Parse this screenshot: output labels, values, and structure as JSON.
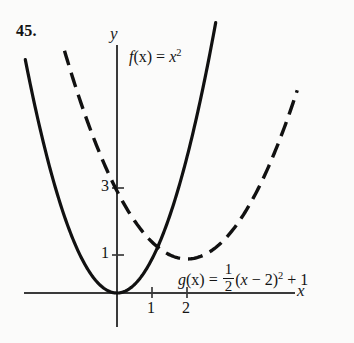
{
  "figure": {
    "problem_number": "45.",
    "background_color": "#fbfbfa",
    "curve_color": "#111111",
    "axis_color": "#333333"
  },
  "axes": {
    "x_axis_label": "x",
    "y_axis_label": "y",
    "origin_px": [
      117,
      293
    ],
    "unit_px_x": 35,
    "unit_px_y": 34,
    "x_ticks": [
      {
        "value": 1,
        "label": "1"
      },
      {
        "value": 2,
        "label": "2"
      }
    ],
    "y_ticks": [
      {
        "value": 1,
        "label": "1"
      },
      {
        "value": 3,
        "label": "3"
      }
    ]
  },
  "labels": {
    "f_name": "f",
    "f_arg": "(x)",
    "f_eq": " = ",
    "f_base": "x",
    "f_exp": "2",
    "g_name": "g",
    "g_arg": "(x)",
    "g_eq": " = ",
    "frac_num": "1",
    "frac_den": "2",
    "g_paren_open": "(",
    "g_var": "x",
    "g_minus": " − ",
    "g_shift": "2",
    "g_paren_close": ")",
    "g_exp": "2",
    "g_plus": " + ",
    "g_const": "1"
  },
  "chart_data": {
    "type": "line",
    "title": "",
    "xlabel": "x",
    "ylabel": "y",
    "xlim": [
      -2.65,
      5.1
    ],
    "ylim": [
      -1.0,
      7.3
    ],
    "grid": false,
    "legend": "inline-annotations",
    "series": [
      {
        "name": "f(x) = x^2",
        "style": "solid",
        "expression": "x^2",
        "vertex": [
          0,
          0
        ],
        "x": [
          -2.6,
          -2.2,
          -1.8,
          -1.4,
          -1.0,
          -0.6,
          -0.2,
          0,
          0.2,
          0.6,
          1.0,
          1.4,
          1.8,
          2.2,
          2.6,
          2.8
        ],
        "y": [
          6.76,
          4.84,
          3.24,
          1.96,
          1.0,
          0.36,
          0.04,
          0,
          0.04,
          0.36,
          1.0,
          1.96,
          3.24,
          4.84,
          6.76,
          7.84
        ]
      },
      {
        "name": "g(x) = 1/2 (x - 2)^2 + 1",
        "style": "dashed",
        "expression": "0.5*(x-2)^2+1",
        "vertex": [
          2,
          1
        ],
        "y_intercept": 3,
        "x": [
          -1.5,
          -1.0,
          -0.5,
          0,
          0.5,
          1.0,
          1.5,
          2.0,
          2.5,
          3.0,
          3.5,
          4.0,
          4.5,
          5.0
        ],
        "y": [
          7.125,
          5.5,
          4.125,
          3.0,
          2.125,
          1.5,
          1.125,
          1.0,
          1.125,
          1.5,
          2.125,
          3.0,
          4.125,
          5.5
        ]
      }
    ],
    "annotations": [
      {
        "text": "f(x) = x^2",
        "x": 0.35,
        "y": 6.6
      },
      {
        "text": "g(x) = 1/2 (x - 2)^2 + 1",
        "x": 1.75,
        "y": 0.65
      }
    ]
  }
}
